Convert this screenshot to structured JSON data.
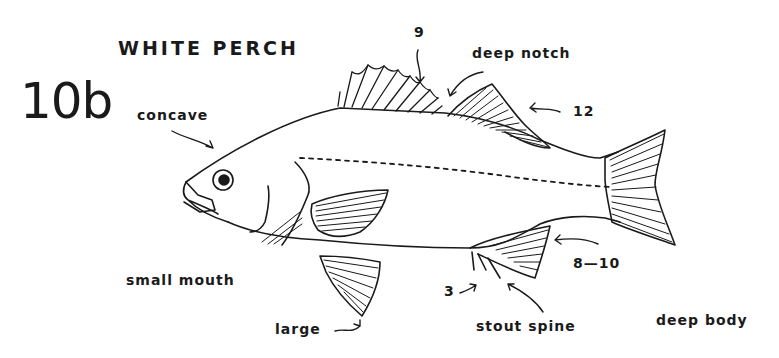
{
  "diagram": {
    "title": "WHITE PERCH",
    "plate_number": "10b",
    "background": "#ffffff",
    "ink_color": "#1a1a1a",
    "annotations": {
      "concave": "concave",
      "first_dorsal_spines": "9",
      "deep_notch": "deep notch",
      "second_dorsal_rays": "12",
      "anal_rays": "8—10",
      "anal_spines": "3",
      "stout_spine": "stout spine",
      "small_mouth": "small mouth",
      "large": "large",
      "deep_body": "deep body"
    }
  }
}
